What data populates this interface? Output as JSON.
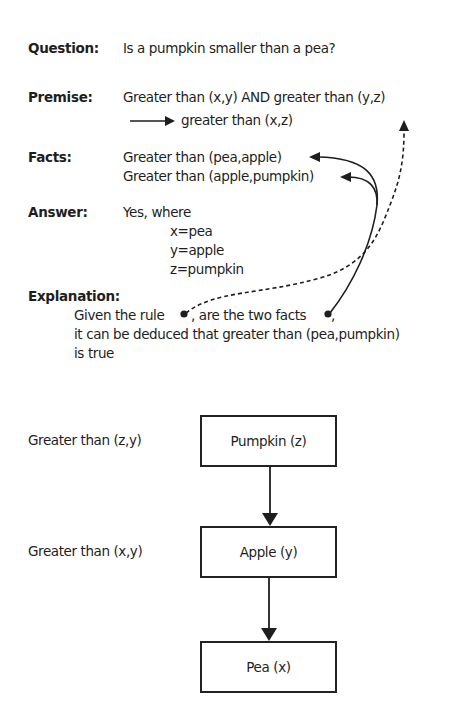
{
  "question": {
    "label": "Question:",
    "text": "Is a pumpkin smaller than a pea?"
  },
  "premise": {
    "label": "Premise:",
    "line1": "Greater than (x,y) AND greater than (y,z)",
    "line2": "greater than (x,z)"
  },
  "facts": {
    "label": "Facts:",
    "items": [
      "Greater than (pea,apple)",
      "Greater than (apple,pumpkin)"
    ]
  },
  "answer": {
    "label": "Answer:",
    "line1": "Yes, where",
    "bindings": [
      "x=pea",
      "y=apple",
      "z=pumpkin"
    ]
  },
  "explanation": {
    "label": "Explanation:",
    "line1a": "Given the rule",
    "line1b": ", are the two facts",
    "line1c": ",",
    "line2": "it can be deduced that greater than (pea,pumpkin)",
    "line3": "is true"
  },
  "hierarchy": {
    "relations": [
      "Greater than (z,y)",
      "Greater than (x,y)"
    ],
    "nodes": [
      "Pumpkin (z)",
      "Apple (y)",
      "Pea (x)"
    ]
  },
  "colors": {
    "ink": "#1e1e1e",
    "background": "#ffffff"
  }
}
